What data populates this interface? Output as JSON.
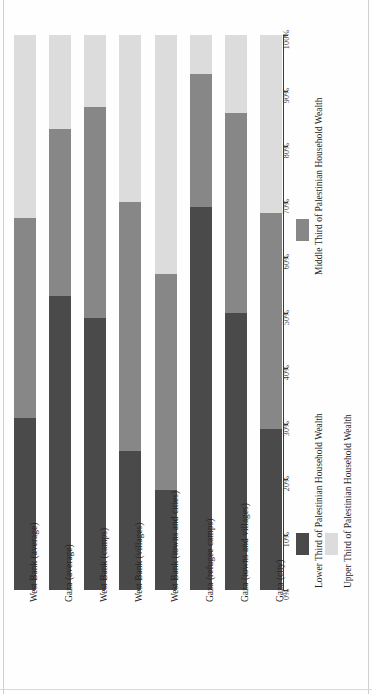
{
  "chart_data": {
    "type": "bar",
    "orientation": "stacked-vertical-rotated",
    "title": "",
    "xlabel": "",
    "ylabel": "",
    "ylim": [
      0,
      100
    ],
    "grid": false,
    "legend_position": "bottom",
    "categories": [
      "West Bank (average)",
      "Gaza (average)",
      "West Bank (camps)",
      "West Bank (villages)",
      "West Bank (towns and cities)",
      "Gaza (refugee camps)",
      "Gaza (towns and villages)",
      "Gaza (city)"
    ],
    "series": [
      {
        "name": "Lower Third of Palestinian Household Wealth",
        "color": "#4a4a4a",
        "values": [
          31,
          53,
          49,
          25,
          18,
          69,
          50,
          29
        ]
      },
      {
        "name": "Middle Third of Palestinian Household Wealth",
        "color": "#878787",
        "values": [
          36,
          30,
          38,
          45,
          39,
          24,
          36,
          39
        ]
      },
      {
        "name": "Upper Third of Palestinian Household Wealth",
        "color": "#dcdcdc",
        "values": [
          33,
          17,
          13,
          30,
          43,
          7,
          14,
          32
        ]
      }
    ],
    "tick_labels": [
      "0%",
      "10%",
      "20%",
      "30%",
      "40%",
      "50%",
      "60%",
      "70%",
      "80%",
      "90%",
      "100%"
    ],
    "tick_values": [
      0,
      10,
      20,
      30,
      40,
      50,
      60,
      70,
      80,
      90,
      100
    ]
  },
  "legend": {
    "entries": [
      {
        "label": "Lower Third of Palestinian Household Wealth",
        "swatch_class": "sw-lower"
      },
      {
        "label": "Middle Third of Palestinian Household Wealth",
        "swatch_class": "sw-middle"
      },
      {
        "label": "Upper Third of Palestinian Household Wealth",
        "swatch_class": "sw-upper"
      }
    ]
  },
  "colors": {
    "lower_third": "#4a4a4a",
    "middle_third": "#878787",
    "upper_third": "#dcdcdc",
    "axis": "#3a3a3a",
    "text": "#262626",
    "page_background": "#fefefe"
  }
}
